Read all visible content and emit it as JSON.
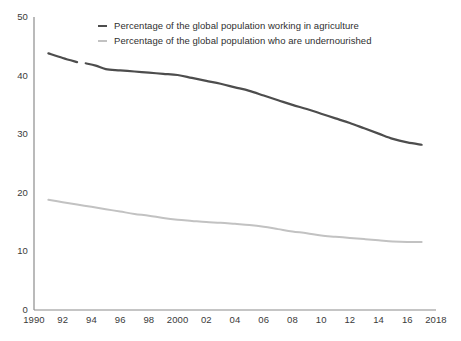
{
  "chart_data": {
    "type": "line",
    "title": "",
    "subtitle": "",
    "xlabel": "",
    "ylabel": "",
    "xlim": [
      1990,
      2018
    ],
    "ylim": [
      0,
      50
    ],
    "grid": false,
    "legend_position": "top-center",
    "x_tick_labels": [
      "1990",
      "92",
      "94",
      "96",
      "98",
      "2000",
      "02",
      "04",
      "06",
      "08",
      "10",
      "12",
      "14",
      "16",
      "2018"
    ],
    "x_tick_values": [
      1990,
      1992,
      1994,
      1996,
      1998,
      2000,
      2002,
      2004,
      2006,
      2008,
      2010,
      2012,
      2014,
      2016,
      2018
    ],
    "y_tick_labels": [
      "0",
      "10",
      "20",
      "30",
      "40",
      "50"
    ],
    "y_tick_values": [
      0,
      10,
      20,
      30,
      40,
      50
    ],
    "series": [
      {
        "name": "Percentage of the global population working in agriculture",
        "color": "#4d4d4d",
        "width": 2.2,
        "x": [
          1991,
          1992,
          1993,
          1993.6,
          1994.3,
          1995,
          1996,
          1997,
          1998,
          1999,
          2000,
          2001,
          2002,
          2003,
          2004,
          2005,
          2006,
          2007,
          2008,
          2009,
          2010,
          2011,
          2012,
          2013,
          2014,
          2015,
          2016,
          2017
        ],
        "values": [
          43.8,
          43.0,
          42.3,
          42.1,
          41.7,
          41.1,
          40.9,
          40.7,
          40.5,
          40.3,
          40.1,
          39.6,
          39.1,
          38.6,
          38.0,
          37.4,
          36.6,
          35.8,
          35.0,
          34.3,
          33.5,
          32.7,
          31.9,
          31.0,
          30.1,
          29.2,
          28.6,
          28.2
        ],
        "gaps": [
          [
            1993.0,
            1993.6
          ]
        ]
      },
      {
        "name": "Percentage of the global population who are undernourished",
        "color": "#c2c2c2",
        "width": 2.0,
        "x": [
          1991,
          1992,
          1993,
          1994,
          1995,
          1996,
          1997,
          1998,
          1999,
          2000,
          2001,
          2002,
          2003,
          2004,
          2005,
          2006,
          2007,
          2008,
          2009,
          2010,
          2011,
          2012,
          2013,
          2014,
          2015,
          2016,
          2017
        ],
        "values": [
          18.8,
          18.4,
          18.0,
          17.6,
          17.2,
          16.8,
          16.4,
          16.1,
          15.7,
          15.4,
          15.2,
          15.0,
          14.9,
          14.7,
          14.5,
          14.2,
          13.8,
          13.4,
          13.1,
          12.7,
          12.5,
          12.3,
          12.1,
          11.9,
          11.7,
          11.6,
          11.6
        ]
      }
    ]
  },
  "legend": {
    "items": [
      {
        "label": "Percentage of the global population working in agriculture",
        "color": "#4d4d4d"
      },
      {
        "label": "Percentage of the global population who are undernourished",
        "color": "#c2c2c2"
      }
    ]
  },
  "axes": {
    "axis_color": "#8c8c8c"
  }
}
